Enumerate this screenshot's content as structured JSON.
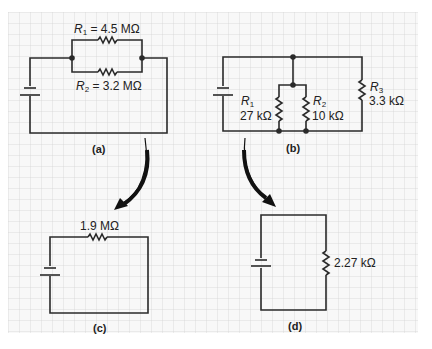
{
  "colors": {
    "grid_line": "#d4d4d4",
    "grid_bg": "#f7f7f7",
    "wire": "#2a2a2a",
    "arrow": "#111111",
    "text": "#222222"
  },
  "circuits": {
    "a": {
      "caption": "(a)",
      "r1": {
        "sym": "R",
        "sub": "1",
        "value": "= 4.5 MΩ"
      },
      "r2": {
        "sym": "R",
        "sub": "2",
        "value": "= 3.2 MΩ"
      },
      "topology": "two resistors in parallel with battery"
    },
    "b": {
      "caption": "(b)",
      "r1": {
        "sym": "R",
        "sub": "1",
        "value": "27 kΩ"
      },
      "r2": {
        "sym": "R",
        "sub": "2",
        "value": "10 kΩ"
      },
      "r3": {
        "sym": "R",
        "sub": "3",
        "value": "3.3 kΩ"
      },
      "topology": "three resistors in parallel with battery"
    },
    "c": {
      "caption": "(c)",
      "req": {
        "value": "1.9 MΩ"
      },
      "topology": "equivalent single resistor of (a)"
    },
    "d": {
      "caption": "(d)",
      "req": {
        "value": "2.27 kΩ"
      },
      "topology": "equivalent single resistor of (b)"
    }
  },
  "arrows": [
    {
      "from": "a",
      "to": "c"
    },
    {
      "from": "b",
      "to": "d"
    }
  ]
}
